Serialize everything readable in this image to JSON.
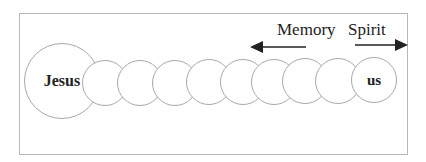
{
  "diagram": {
    "nodes": [
      {
        "id": "jesus",
        "label": "Jesus",
        "cx": 62,
        "cy": 81,
        "r": 38
      },
      {
        "id": "c1",
        "label": "",
        "cx": 105,
        "cy": 83,
        "r": 23
      },
      {
        "id": "c2",
        "label": "",
        "cx": 140,
        "cy": 83,
        "r": 23
      },
      {
        "id": "c3",
        "label": "",
        "cx": 175,
        "cy": 83,
        "r": 23
      },
      {
        "id": "c4",
        "label": "",
        "cx": 209,
        "cy": 82,
        "r": 23
      },
      {
        "id": "c5",
        "label": "",
        "cx": 243,
        "cy": 82,
        "r": 23
      },
      {
        "id": "c6",
        "label": "",
        "cx": 274,
        "cy": 82,
        "r": 23
      },
      {
        "id": "c7",
        "label": "",
        "cx": 305,
        "cy": 81,
        "r": 23
      },
      {
        "id": "c8",
        "label": "",
        "cx": 338,
        "cy": 81,
        "r": 23
      },
      {
        "id": "us",
        "label": "us",
        "cx": 374,
        "cy": 80,
        "r": 23
      }
    ],
    "arrows": [
      {
        "label": "Memory",
        "direction": "left"
      },
      {
        "label": "Spirit",
        "direction": "right"
      }
    ],
    "colors": {
      "stroke": "#a8a8a8",
      "arrow": "#222222"
    }
  }
}
